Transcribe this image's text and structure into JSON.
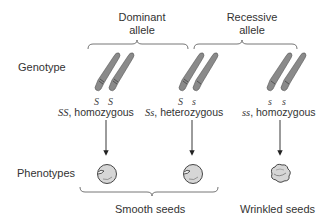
{
  "headers": {
    "dominant": [
      "Dominant",
      "allele"
    ],
    "recessive": [
      "Recessive",
      "allele"
    ]
  },
  "row_labels": {
    "genotype": "Genotype",
    "phenotypes": "Phenotypes"
  },
  "genotypes": [
    {
      "alleles": [
        "S",
        "S"
      ],
      "symbol": "SS",
      "description": ", homozygous",
      "phenotype": "smooth"
    },
    {
      "alleles": [
        "S",
        "s"
      ],
      "symbol": "Ss",
      "description": ", heterozygous",
      "phenotype": "smooth"
    },
    {
      "alleles": [
        "s",
        "s"
      ],
      "symbol": "ss",
      "description": ", homozygous",
      "phenotype": "wrinkled"
    }
  ],
  "phenotype_groups": {
    "smooth": "Smooth seeds",
    "wrinkled": "Wrinkled seeds"
  },
  "colors": {
    "chromosome": "#8a8a8a",
    "seed": "#d6d6d6",
    "line": "#555555"
  }
}
